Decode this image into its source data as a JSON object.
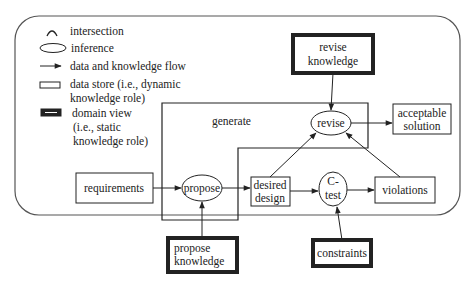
{
  "legend": {
    "intersection": "intersection",
    "inference": "inference",
    "flow": "data and knowledge flow",
    "data_store_1": "data store (i.e., dynamic",
    "data_store_2": "knowledge role)",
    "domain_view_1": "domain view",
    "domain_view_2": "(i.e., static",
    "domain_view_3": "knowledge role)"
  },
  "nodes": {
    "revise_knowledge_1": "revise",
    "revise_knowledge_2": "knowledge",
    "generate": "generate",
    "revise": "revise",
    "acceptable_solution_1": "acceptable",
    "acceptable_solution_2": "solution",
    "requirements": "requirements",
    "propose": "propose",
    "desired_design_1": "desired",
    "desired_design_2": "design",
    "ctest_1": "C-",
    "ctest_2": "test",
    "violations": "violations",
    "propose_knowledge_1": "propose",
    "propose_knowledge_2": "knowledge",
    "constraints": "constraints"
  },
  "colors": {
    "stroke": "#222222",
    "background": "#ffffff"
  }
}
